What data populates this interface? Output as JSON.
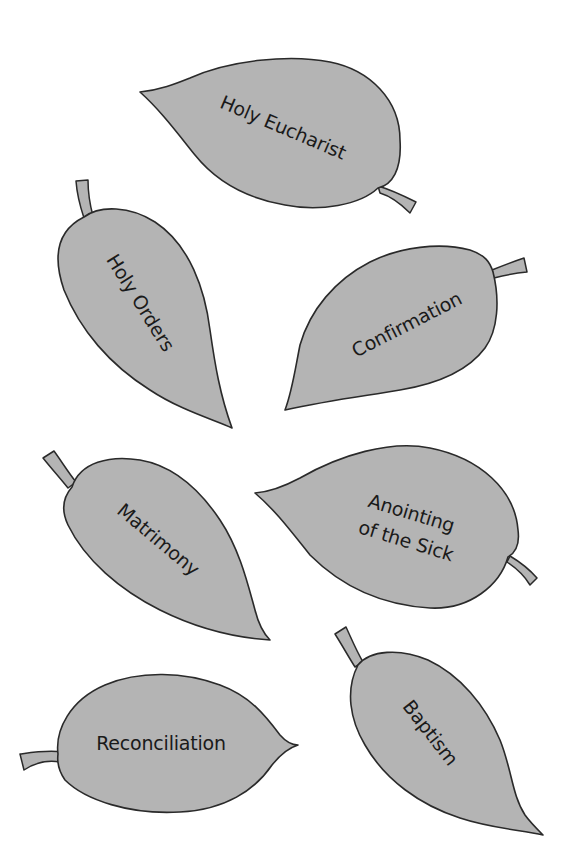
{
  "colors": {
    "leaf_fill": "#b4b4b4",
    "leaf_outline": "#2a2a2a",
    "text": "#1a1a1a",
    "background": "#ffffff"
  },
  "leaves": [
    {
      "id": "holy-eucharist",
      "label": "Holy Eucharist",
      "lines": [
        "Holy Eucharist"
      ]
    },
    {
      "id": "holy-orders",
      "label": "Holy Orders",
      "lines": [
        "Holy Orders"
      ]
    },
    {
      "id": "confirmation",
      "label": "Confirmation",
      "lines": [
        "Confirmation"
      ]
    },
    {
      "id": "matrimony",
      "label": "Matrimony",
      "lines": [
        "Matrimony"
      ]
    },
    {
      "id": "anointing-of-the-sick",
      "label": "Anointing of the Sick",
      "lines": [
        "Anointing",
        "of the Sick"
      ]
    },
    {
      "id": "reconciliation",
      "label": "Reconciliation",
      "lines": [
        "Reconciliation"
      ]
    },
    {
      "id": "baptism",
      "label": "Baptism",
      "lines": [
        "Baptism"
      ]
    }
  ]
}
